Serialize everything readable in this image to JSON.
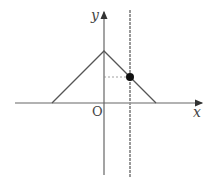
{
  "diagram": {
    "axis_labels": {
      "x": "x",
      "y": "y",
      "origin": "O"
    },
    "shapes": {
      "triangle_graph": {
        "left_base": [
          -2,
          0
        ],
        "apex": [
          0,
          2
        ],
        "right_base": [
          2,
          0
        ]
      },
      "vertical_line": {
        "x": 1.0
      },
      "point": {
        "x": 1.0,
        "y": 1.0
      }
    },
    "colors": {
      "axis": "#555555",
      "graph": "#555555",
      "line": "#9a9a9a",
      "point": "#111111"
    }
  }
}
